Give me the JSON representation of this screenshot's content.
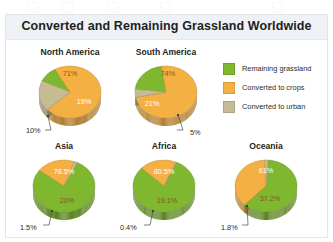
{
  "figure": {
    "title": "Converted and Remaining Grassland Worldwide"
  },
  "legend": {
    "items": [
      {
        "label": "Remaining grassland",
        "color": "#7fb72f",
        "key": "grassland"
      },
      {
        "label": "Converted to crops",
        "color": "#f5b043",
        "key": "crops"
      },
      {
        "label": "Converted to urban",
        "color": "#c6bb93",
        "key": "urban"
      }
    ]
  },
  "chart_data": {
    "type": "pie",
    "title": "Converted and Remaining Grassland Worldwide",
    "xlabel": "",
    "ylabel": "",
    "units": "percent",
    "legend_position": "top-right",
    "grid": false,
    "categories": [
      "Remaining grassland",
      "Converted to crops",
      "Converted to urban"
    ],
    "category_colors": [
      "#7fb72f",
      "#f5b043",
      "#c6bb93"
    ],
    "panels": [
      {
        "name": "North America",
        "row": 0,
        "values": [
          10,
          71,
          19
        ],
        "labels": [
          "10%",
          "71%",
          "19%"
        ],
        "callout": "10%"
      },
      {
        "name": "South America",
        "row": 0,
        "values": [
          21,
          74,
          5
        ],
        "labels": [
          "21%",
          "74%",
          "5%"
        ],
        "callout": "5%"
      },
      {
        "name": "Asia",
        "row": 1,
        "values": [
          78.5,
          20,
          1.5
        ],
        "labels": [
          "78.5%",
          "20%",
          "1.5%"
        ],
        "callout": "1.5%"
      },
      {
        "name": "Africa",
        "row": 1,
        "values": [
          80.5,
          19.1,
          0.4
        ],
        "labels": [
          "80.5%",
          "19.1%",
          "0.4%"
        ],
        "callout": "0.4%"
      },
      {
        "name": "Oceania",
        "row": 1,
        "values": [
          61,
          37.2,
          1.8
        ],
        "labels": [
          "61%",
          "37.2%",
          "1.8%"
        ],
        "callout": "1.8%"
      }
    ]
  }
}
